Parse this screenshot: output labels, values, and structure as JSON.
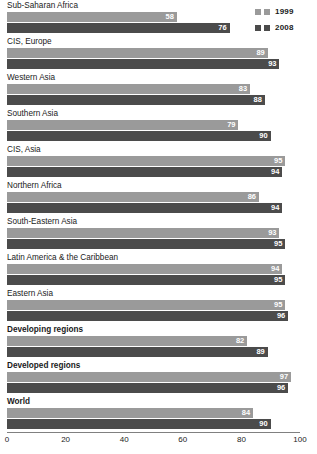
{
  "legend": {
    "position": "top-right",
    "entries": [
      {
        "label": "1999",
        "color": "#9a9a9a",
        "swatch_name": "legend-swatch-1999"
      },
      {
        "label": "2008",
        "color": "#4b4b4b",
        "swatch_name": "legend-swatch-2008"
      }
    ]
  },
  "axis": {
    "ticks": [
      "0",
      "20",
      "40",
      "60",
      "80",
      "100"
    ],
    "min": 0,
    "max": 100
  },
  "chart_data": {
    "type": "bar",
    "orientation": "horizontal",
    "title": "",
    "subtitle": "",
    "xlabel": "",
    "ylabel": "",
    "xlim": [
      0,
      100
    ],
    "grid": false,
    "legend_position": "top-right",
    "categories": [
      "Sub-Saharan Africa",
      "CIS, Europe",
      "Western Asia",
      "Southern Asia",
      "CIS, Asia",
      "Northern Africa",
      "South-Eastern Asia",
      "Latin America & the Caribbean",
      "Eastern Asia",
      "Developing regions",
      "Developed regions",
      "World"
    ],
    "emphasized_categories": [
      "Developing regions",
      "Developed regions",
      "World"
    ],
    "series": [
      {
        "name": "1999",
        "color": "#9a9a9a",
        "values": [
          58,
          89,
          83,
          79,
          95,
          86,
          93,
          94,
          95,
          82,
          97,
          84
        ]
      },
      {
        "name": "2008",
        "color": "#4b4b4b",
        "values": [
          76,
          93,
          88,
          90,
          94,
          94,
          95,
          95,
          96,
          89,
          96,
          90
        ]
      }
    ]
  }
}
